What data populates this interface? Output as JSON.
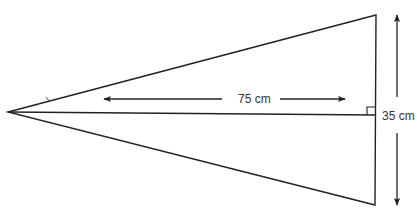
{
  "diagram": {
    "type": "isosceles-triangle-dimensions",
    "shape": "triangle",
    "labels": {
      "height": "75 cm",
      "half_base": "35 cm"
    },
    "annotations": {
      "right_angle_marker": true,
      "height_arrow": "double-headed horizontal",
      "half_base_arrow": "double-headed vertical"
    },
    "colors": {
      "stroke": "#222222",
      "text": "#333333",
      "background": "#ffffff"
    }
  }
}
